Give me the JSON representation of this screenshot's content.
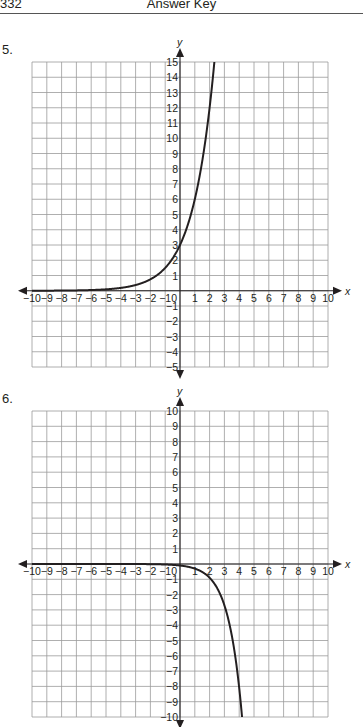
{
  "header": {
    "page_number": "332",
    "title": "Answer Key"
  },
  "problems": [
    {
      "label": "5.",
      "label_top": 42
    },
    {
      "label": "6.",
      "label_top": 391
    }
  ],
  "chart_data": [
    {
      "type": "line",
      "title": "5.",
      "xlabel": "x",
      "ylabel": "y",
      "xlim": [
        -10,
        10
      ],
      "ylim": [
        -5,
        15
      ],
      "grid": true,
      "x_ticks": [
        -10,
        -9,
        -8,
        -7,
        -6,
        -5,
        -4,
        -3,
        -2,
        -1,
        0,
        1,
        2,
        3,
        4,
        5,
        6,
        7,
        8,
        9,
        10
      ],
      "y_ticks": [
        -5,
        -4,
        -3,
        -2,
        -1,
        1,
        2,
        3,
        4,
        5,
        6,
        7,
        8,
        9,
        10,
        11,
        12,
        13,
        14,
        15
      ],
      "function": "y = 3·2^x",
      "coef": 3,
      "base": 2,
      "series": [
        {
          "name": "curve",
          "x": [
            -10,
            -6,
            -4,
            -3,
            -2,
            -1,
            0,
            1,
            2,
            2.32
          ],
          "y": [
            0.003,
            0.05,
            0.19,
            0.38,
            0.75,
            1.5,
            3,
            6,
            12,
            15
          ]
        }
      ],
      "frame": {
        "left": 32,
        "right": 328,
        "top": 62,
        "bottom": 367
      }
    },
    {
      "type": "line",
      "title": "6.",
      "xlabel": "x",
      "ylabel": "y",
      "xlim": [
        -10,
        10
      ],
      "ylim": [
        -10,
        10
      ],
      "grid": true,
      "x_ticks": [
        -10,
        -9,
        -8,
        -7,
        -6,
        -5,
        -4,
        -3,
        -2,
        -1,
        0,
        1,
        2,
        3,
        4,
        5,
        6,
        7,
        8,
        9,
        10
      ],
      "y_ticks": [
        -10,
        -9,
        -8,
        -7,
        -6,
        -5,
        -4,
        -3,
        -2,
        -1,
        1,
        2,
        3,
        4,
        5,
        6,
        7,
        8,
        9,
        10
      ],
      "function": "y = -0.1·3^x",
      "coef": -0.1,
      "base": 3,
      "series": [
        {
          "name": "curve",
          "x": [
            -10,
            -2,
            0,
            1,
            2,
            3,
            4,
            4.19
          ],
          "y": [
            0,
            -0.01,
            -0.1,
            -0.3,
            -0.9,
            -2.7,
            -8.1,
            -10
          ]
        }
      ],
      "frame": {
        "left": 32,
        "right": 328,
        "top": 411,
        "bottom": 717
      }
    }
  ]
}
